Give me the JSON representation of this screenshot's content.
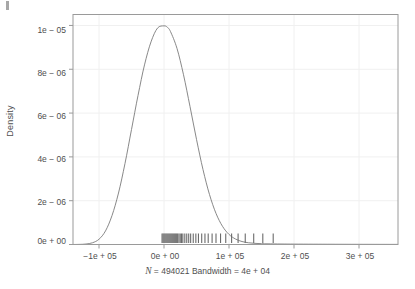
{
  "chart_data": {
    "type": "line",
    "title": "",
    "subtitle": "",
    "xlabel": "",
    "ylabel": "Density",
    "caption": "N = 494021 Bandwidth = 4e + 04",
    "caption_n_symbol": "N",
    "caption_rest": " = 494021 Bandwidth = 4e + 04",
    "grid": true,
    "legend": "none",
    "xlim": [
      -140000,
      360000
    ],
    "ylim": [
      0,
      1.05e-05
    ],
    "xticks": [
      -100000,
      0,
      100000,
      200000,
      300000
    ],
    "xticklabels": [
      "−1e + 05",
      "0e + 00",
      "1e + 05",
      "2e + 05",
      "3e + 05"
    ],
    "yticks": [
      0,
      2e-06,
      4e-06,
      6e-06,
      8e-06,
      1e-05
    ],
    "yticklabels": [
      "0e + 00",
      "2e − 06",
      "4e − 06",
      "6e − 06",
      "8e − 06",
      "1e − 05"
    ],
    "series": [
      {
        "name": "density",
        "color": "#7a7a7a",
        "x": [
          -140000,
          -130000,
          -120000,
          -110000,
          -100000,
          -90000,
          -80000,
          -70000,
          -60000,
          -50000,
          -40000,
          -30000,
          -20000,
          -10000,
          0,
          5000,
          10000,
          20000,
          30000,
          40000,
          50000,
          60000,
          70000,
          80000,
          90000,
          100000,
          110000,
          120000,
          130000,
          140000,
          150000,
          160000,
          180000,
          200000,
          230000,
          260000,
          300000,
          360000
        ],
        "y": [
          1e-09,
          5e-09,
          2.2e-08,
          8e-08,
          2.4e-07,
          6.2e-07,
          1.32e-06,
          2.35e-06,
          3.7e-06,
          5.25e-06,
          6.8e-06,
          8.2e-06,
          9.25e-06,
          9.88e-06,
          9.98e-06,
          9.92e-06,
          9.72e-06,
          8.95e-06,
          7.75e-06,
          6.3e-06,
          4.8e-06,
          3.42e-06,
          2.28e-06,
          1.42e-06,
          8.3e-07,
          4.6e-07,
          2.5e-07,
          1.35e-07,
          8e-08,
          5.2e-08,
          3.8e-08,
          3e-08,
          2.2e-08,
          1.8e-08,
          1.4e-08,
          1.1e-08,
          8e-09,
          5e-09
        ]
      }
    ],
    "rug": {
      "name": "rug-marks",
      "color": "#6b6b6b",
      "values": [
        -3000,
        -1500,
        0,
        1500,
        3000,
        4500,
        6000,
        7500,
        9000,
        10500,
        12000,
        13500,
        15000,
        16500,
        18000,
        19500,
        21000,
        23000,
        25000,
        27000,
        29000,
        32000,
        35000,
        38000,
        41000,
        45000,
        49000,
        53000,
        58000,
        63000,
        68000,
        74000,
        80000,
        87000,
        95000,
        104000,
        114000,
        125000,
        138000,
        152000,
        168000
      ]
    }
  },
  "axes": {
    "frame_color": "#9a9a9a",
    "grid_color": "#f0f0f0",
    "tick_color": "#9a9a9a",
    "background": "#ffffff"
  }
}
